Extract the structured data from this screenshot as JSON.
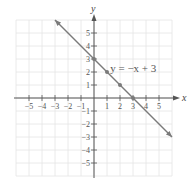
{
  "chart_data": {
    "type": "line",
    "title": "",
    "xlabel": "x",
    "ylabel": "y",
    "xlim": [
      -6,
      6
    ],
    "ylim": [
      -6,
      6
    ],
    "grid": true,
    "x_ticks": [
      -5,
      -4,
      -3,
      -2,
      -1,
      1,
      2,
      3,
      4,
      5
    ],
    "y_ticks": [
      -5,
      -4,
      -3,
      -2,
      -1,
      1,
      2,
      3,
      4,
      5
    ],
    "x_tick_labels": [
      "−5",
      "−4",
      "−3",
      "−2",
      "−1",
      "1",
      "2",
      "3",
      "4",
      "5"
    ],
    "y_tick_labels": [
      "−5",
      "−4",
      "−3",
      "−2",
      "−1",
      "1",
      "2",
      "3",
      "4",
      "5"
    ],
    "series": [
      {
        "name": "y = −x + 3",
        "equation": "y = -x + 3",
        "slope": -1,
        "intercept": 3,
        "line_start": [
          -3,
          6
        ],
        "line_end": [
          6,
          -3
        ],
        "arrows": "both",
        "points": [
          [
            0,
            3
          ],
          [
            1,
            2
          ],
          [
            2,
            1
          ],
          [
            3,
            0
          ]
        ]
      }
    ],
    "annotations": [
      {
        "text": "y = −x + 3",
        "x": 3.4,
        "y": 2.3
      }
    ]
  },
  "colors": {
    "line": "#7a7a7a",
    "axis": "#555555",
    "grid": "#e4e4e4",
    "points": "#7a7a7a"
  },
  "labels": {
    "x_axis": "x",
    "y_axis": "y",
    "equation": "y = −x + 3"
  }
}
